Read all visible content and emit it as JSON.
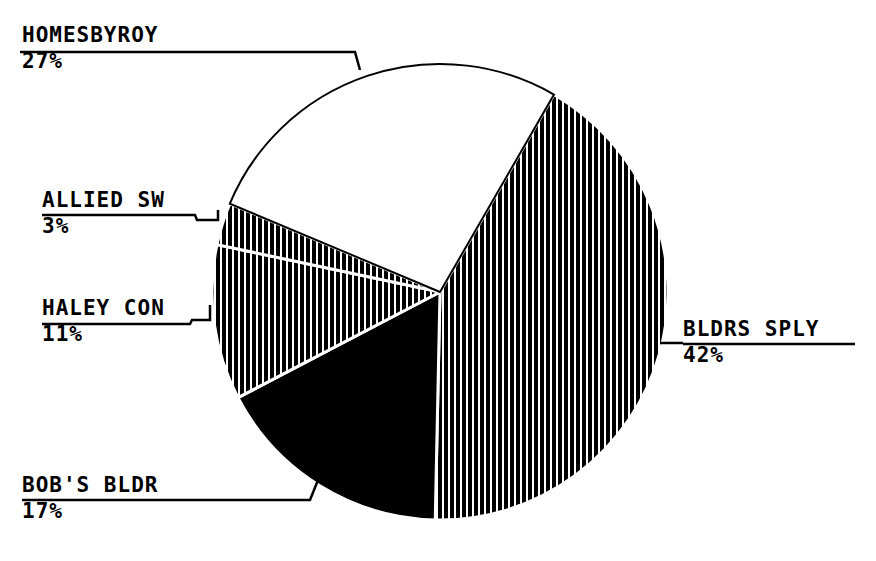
{
  "chart_data": {
    "type": "pie",
    "title": "",
    "categories": [
      "BLDRS SPLY",
      "BOB'S BLDR",
      "HALEY CON",
      "ALLIED SW",
      "HOMESBYROY"
    ],
    "values": [
      42,
      17,
      11,
      3,
      27
    ],
    "labels": [
      "42%",
      "17%",
      "11%",
      "3%",
      "27%"
    ],
    "fills": [
      "vertical-hatch",
      "solid-black",
      "vertical-hatch",
      "vertical-hatch",
      "white"
    ],
    "start_angle_deg": 30,
    "direction": "clockwise",
    "legend": "none",
    "center": [
      440,
      292
    ],
    "radius": 228
  },
  "labels": {
    "homes": {
      "name": "HOMESBYROY",
      "pct": "27%"
    },
    "allied": {
      "name": "ALLIED SW",
      "pct": "3%"
    },
    "haley": {
      "name": "HALEY CON",
      "pct": "11%"
    },
    "bldrs": {
      "name": "BLDRS SPLY",
      "pct": "42%"
    },
    "bobs": {
      "name": "BOB'S BLDR",
      "pct": "17%"
    }
  }
}
